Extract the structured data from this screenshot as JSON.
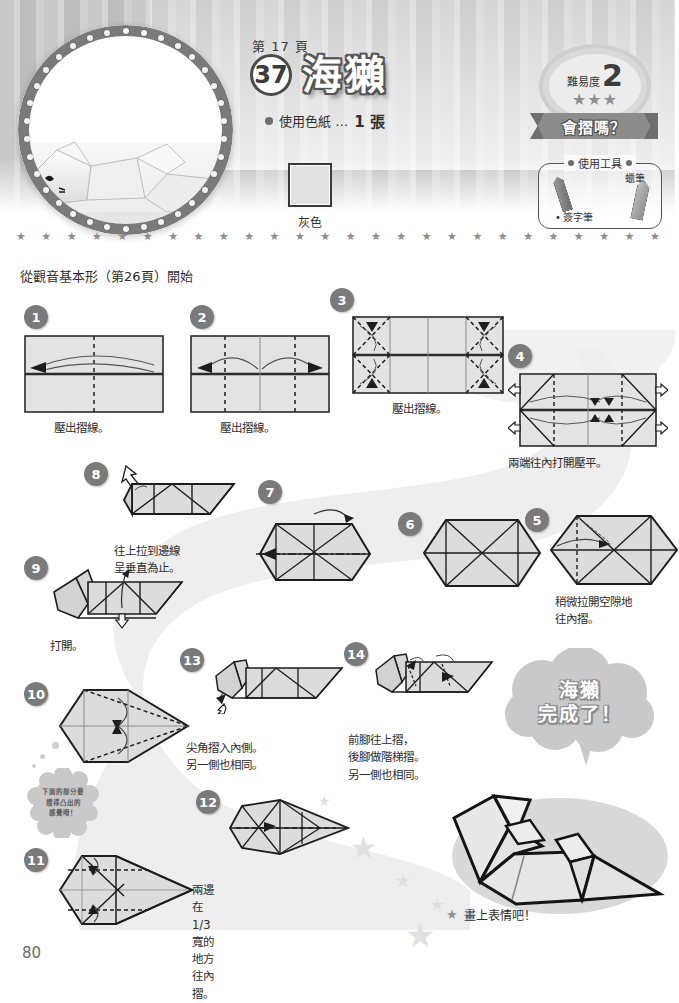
{
  "header": {
    "page_ref": "第 17 頁",
    "model_number": "37",
    "model_name": "海獺",
    "paper_label": "使用色紙 …",
    "paper_count": "1 張",
    "color_swatch_label": "灰色",
    "color_swatch_hex": "#e2e2e2"
  },
  "difficulty": {
    "label": "難易度",
    "level": "2",
    "stars": "★★★",
    "ribbon_text": "會摺嗎？"
  },
  "tools": {
    "title": "使用工具",
    "crayon_label": "蠟筆",
    "marker_label": "簽字筆"
  },
  "intro": {
    "text": "從觀音基本形（第26頁）開始"
  },
  "steps": [
    {
      "num": "1",
      "caption": "壓出摺線。"
    },
    {
      "num": "2",
      "caption": "壓出摺線。"
    },
    {
      "num": "3",
      "caption": "壓出摺線。"
    },
    {
      "num": "4",
      "caption": "兩端往內打開壓平。"
    },
    {
      "num": "5",
      "caption": "稍微拉開空隙地\n往內摺。"
    },
    {
      "num": "6",
      "caption": ""
    },
    {
      "num": "7",
      "caption": ""
    },
    {
      "num": "8",
      "caption": "往上拉到邊線\n呈垂直為止。"
    },
    {
      "num": "9",
      "caption": "打開。"
    },
    {
      "num": "10",
      "caption": ""
    },
    {
      "num": "11",
      "caption": "兩邊在1/3寬的\n地方往內摺。"
    },
    {
      "num": "12",
      "caption": ""
    },
    {
      "num": "13",
      "caption": "尖角摺入內側。\n另一側也相同。"
    },
    {
      "num": "14",
      "caption": "前腳往上摺，\n後腳做階梯摺。\n另一側也相同。"
    }
  ],
  "hint_bubble": {
    "text": "下面的部分要\n摺得凸出的\n感覺唷！"
  },
  "finish": {
    "name": "海獺",
    "done": "完成了！",
    "note": "畫上表情吧！",
    "note_star": "★"
  },
  "footer": {
    "page_number": "80"
  },
  "divider": {
    "stars": "★ ★ ★ ★ ★ ★ ★ ★ ★ ★ ★ ★ ★ ★ ★ ★ ★ ★ ★ ★ ★ ★ ★ ★ ★ ★ ★ ★ ★ ★ ★ ★ ★"
  }
}
